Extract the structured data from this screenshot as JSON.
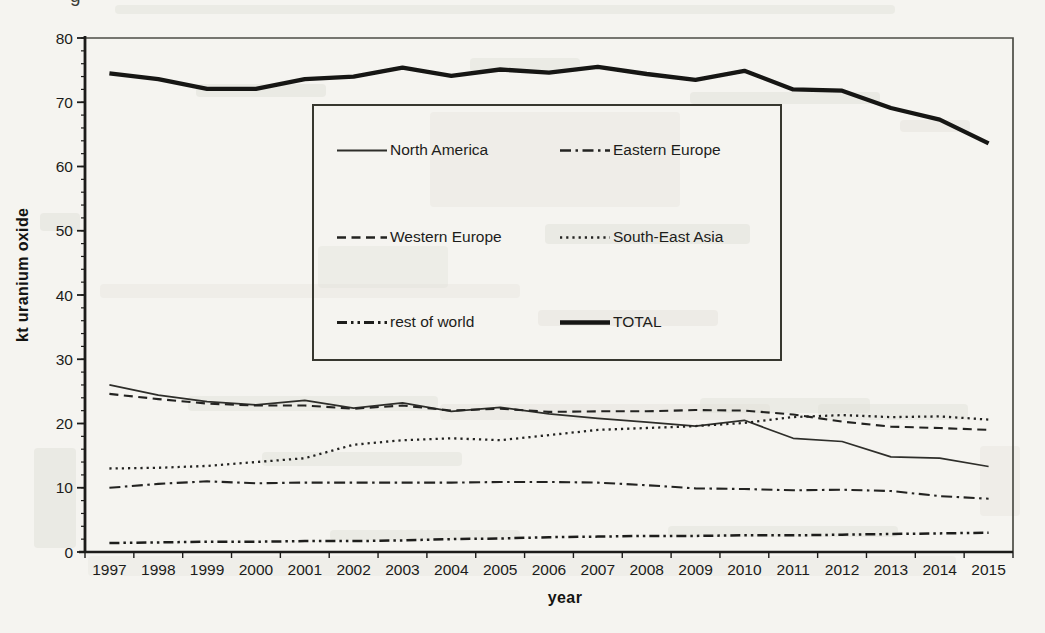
{
  "artifacts": {
    "partial_glyph": "g"
  },
  "chart_data": {
    "type": "line",
    "title": "",
    "xlabel": "year",
    "ylabel": "kt uranium oxide",
    "x": [
      1997,
      1998,
      1999,
      2000,
      2001,
      2002,
      2003,
      2004,
      2005,
      2006,
      2007,
      2008,
      2009,
      2010,
      2011,
      2012,
      2013,
      2014,
      2015
    ],
    "ylim": [
      0,
      80
    ],
    "ytick_interval": 10,
    "yminor_interval": 2,
    "grid": false,
    "legend_position": "inside-top-center",
    "series": [
      {
        "name": "North America",
        "style": "solid-thin",
        "values": [
          26.0,
          24.4,
          23.4,
          22.9,
          23.6,
          22.4,
          23.2,
          21.9,
          22.5,
          21.5,
          20.8,
          20.2,
          19.6,
          20.5,
          17.7,
          17.2,
          14.8,
          14.6,
          13.3
        ]
      },
      {
        "name": "Eastern Europe",
        "style": "dash-dot",
        "values": [
          10.0,
          10.6,
          11.0,
          10.7,
          10.8,
          10.8,
          10.8,
          10.8,
          10.9,
          10.9,
          10.8,
          10.4,
          9.9,
          9.8,
          9.6,
          9.7,
          9.5,
          8.7,
          8.3
        ]
      },
      {
        "name": "Western Europe",
        "style": "dashed",
        "values": [
          24.6,
          23.8,
          23.1,
          22.8,
          22.8,
          22.3,
          22.8,
          22.0,
          22.3,
          21.8,
          21.9,
          21.9,
          22.1,
          22.0,
          21.4,
          20.3,
          19.5,
          19.3,
          19.0
        ]
      },
      {
        "name": "South-East Asia",
        "style": "dotted",
        "values": [
          13.0,
          13.1,
          13.4,
          14.0,
          14.6,
          16.7,
          17.4,
          17.7,
          17.4,
          18.2,
          19.0,
          19.3,
          19.6,
          20.1,
          21.0,
          21.3,
          21.0,
          21.1,
          20.6
        ]
      },
      {
        "name": "rest of world",
        "style": "dash-dot-dot",
        "values": [
          1.4,
          1.5,
          1.6,
          1.6,
          1.7,
          1.7,
          1.8,
          2.0,
          2.1,
          2.3,
          2.4,
          2.5,
          2.5,
          2.6,
          2.6,
          2.7,
          2.8,
          2.9,
          3.0
        ]
      },
      {
        "name": "TOTAL",
        "style": "solid-thick",
        "values": [
          74.5,
          73.6,
          72.1,
          72.1,
          73.6,
          74.0,
          75.4,
          74.1,
          75.1,
          74.6,
          75.5,
          74.4,
          73.5,
          74.9,
          72.0,
          71.8,
          69.1,
          67.3,
          63.6
        ]
      }
    ]
  }
}
